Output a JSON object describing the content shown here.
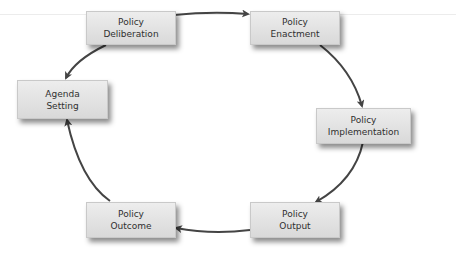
{
  "diagram": {
    "type": "cycle",
    "colors": {
      "box_fill": "#e3e3e3",
      "arrow": "#444444",
      "text": "#2f2f2f"
    },
    "nodes": [
      {
        "id": "deliberation",
        "line1": "Policy",
        "line2": "Deliberation"
      },
      {
        "id": "enactment",
        "line1": "Policy",
        "line2": "Enactment"
      },
      {
        "id": "implementation",
        "line1": "Policy",
        "line2": "Implementation"
      },
      {
        "id": "output",
        "line1": "Policy",
        "line2": "Output"
      },
      {
        "id": "outcome",
        "line1": "Policy",
        "line2": "Outcome"
      },
      {
        "id": "agenda",
        "line1": "Agenda",
        "line2": "Setting"
      }
    ],
    "edges": [
      [
        "deliberation",
        "enactment"
      ],
      [
        "enactment",
        "implementation"
      ],
      [
        "implementation",
        "output"
      ],
      [
        "output",
        "outcome"
      ],
      [
        "outcome",
        "agenda"
      ],
      [
        "agenda",
        "deliberation"
      ]
    ]
  }
}
